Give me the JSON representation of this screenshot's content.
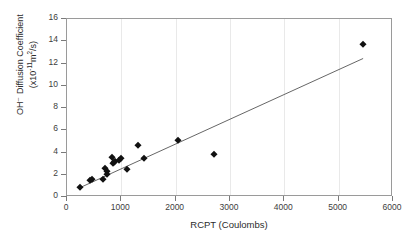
{
  "chart_data": {
    "type": "scatter",
    "title": "",
    "xlabel": "RCPT (Coulombs)",
    "ylabel_line1": "OH⁻ Diffusion Coefficient",
    "ylabel_line2_prefix": "(x10",
    "ylabel_line2_exp": "-11",
    "ylabel_line2_mid": "m",
    "ylabel_line2_sup": "2",
    "ylabel_line2_suffix": "/s)",
    "xlim": [
      0,
      6000
    ],
    "ylim": [
      0,
      16
    ],
    "xticks": [
      0,
      1000,
      2000,
      3000,
      4000,
      5000,
      6000
    ],
    "yticks": [
      0,
      2,
      4,
      6,
      8,
      10,
      12,
      14,
      16
    ],
    "grid": "vertical-light",
    "legend": "none",
    "marker": "filled-diamond",
    "marker_color": "#111111",
    "line_color": "#555555",
    "points": [
      {
        "x": 240,
        "y": 0.9
      },
      {
        "x": 420,
        "y": 1.55
      },
      {
        "x": 455,
        "y": 1.58
      },
      {
        "x": 660,
        "y": 1.58
      },
      {
        "x": 700,
        "y": 2.65
      },
      {
        "x": 735,
        "y": 2.35
      },
      {
        "x": 745,
        "y": 2.1
      },
      {
        "x": 820,
        "y": 3.6
      },
      {
        "x": 840,
        "y": 3.05
      },
      {
        "x": 860,
        "y": 3.15
      },
      {
        "x": 880,
        "y": 3.25
      },
      {
        "x": 960,
        "y": 3.35
      },
      {
        "x": 1000,
        "y": 3.55
      },
      {
        "x": 1100,
        "y": 2.55
      },
      {
        "x": 1300,
        "y": 4.65
      },
      {
        "x": 1420,
        "y": 3.55
      },
      {
        "x": 2050,
        "y": 5.1
      },
      {
        "x": 2700,
        "y": 3.85
      },
      {
        "x": 5450,
        "y": 13.75
      }
    ],
    "trendline": {
      "x1": 230,
      "y1": 0.82,
      "x2": 5450,
      "y2": 12.45
    }
  }
}
